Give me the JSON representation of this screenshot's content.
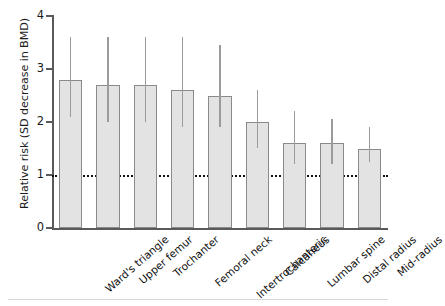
{
  "chart_data": {
    "type": "bar",
    "title": "",
    "xlabel": "",
    "ylabel": "Relative risk (SD decrease in BMD)",
    "ylim": [
      0,
      4
    ],
    "yticks": [
      0,
      1,
      2,
      3,
      4
    ],
    "ytick_labels": [
      "0",
      "1",
      "2",
      "3",
      "4"
    ],
    "grid": false,
    "legend": null,
    "reference_line": {
      "value": 1,
      "style": "dotted",
      "color": "#111111"
    },
    "categories": [
      "Ward's triangle",
      "Upper femur",
      "Trochanter",
      "Femoral neck",
      "Intertrochanteric",
      "Calcaneus",
      "Lumbar spine",
      "Distal radius",
      "Mid-radius"
    ],
    "values": [
      2.8,
      2.7,
      2.7,
      2.6,
      2.5,
      2.0,
      1.6,
      1.6,
      1.5
    ],
    "error_low": [
      2.1,
      2.0,
      2.0,
      1.9,
      1.9,
      1.5,
      1.2,
      1.2,
      1.25
    ],
    "error_high": [
      3.6,
      3.6,
      3.6,
      3.6,
      3.45,
      2.6,
      2.2,
      2.05,
      1.9
    ],
    "bar_color": "#e3e3e3",
    "bar_edge_color": "#8a8a8a",
    "error_color": "#9b9b9b",
    "axis_color": "#5a5a5a"
  }
}
